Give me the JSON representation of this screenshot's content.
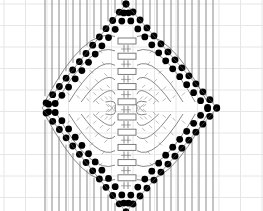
{
  "diagram": {
    "width": 263,
    "height": 211,
    "colors": {
      "background": "#ffffff",
      "grid": "#e6e6e6",
      "stitch_line": "#8a8a8a",
      "dot": "#000000",
      "arc": "#7a7a7a",
      "tick": "#9a9a9a",
      "cable": "#6e6e6e"
    },
    "grid": {
      "spacing": 21.5,
      "offset_x": 4,
      "offset_y": 4
    },
    "diamond": {
      "apex_top": [
        126,
        4
      ],
      "apex_left": [
        42,
        108
      ],
      "apex_right": [
        217,
        108
      ],
      "apex_bottom": [
        126,
        212
      ],
      "dot_rows": 2,
      "dot_spacing": 10.6,
      "dot_radius": 3.4
    },
    "vertical_lines": {
      "spacing": 7,
      "x_start": 45,
      "x_end": 215
    },
    "interior": {
      "arc_count": 6,
      "cable_column": {
        "x": 118,
        "width": 18,
        "height": 6,
        "y_start": 38,
        "y_step": 15.2,
        "count": 10
      }
    },
    "legend": []
  }
}
